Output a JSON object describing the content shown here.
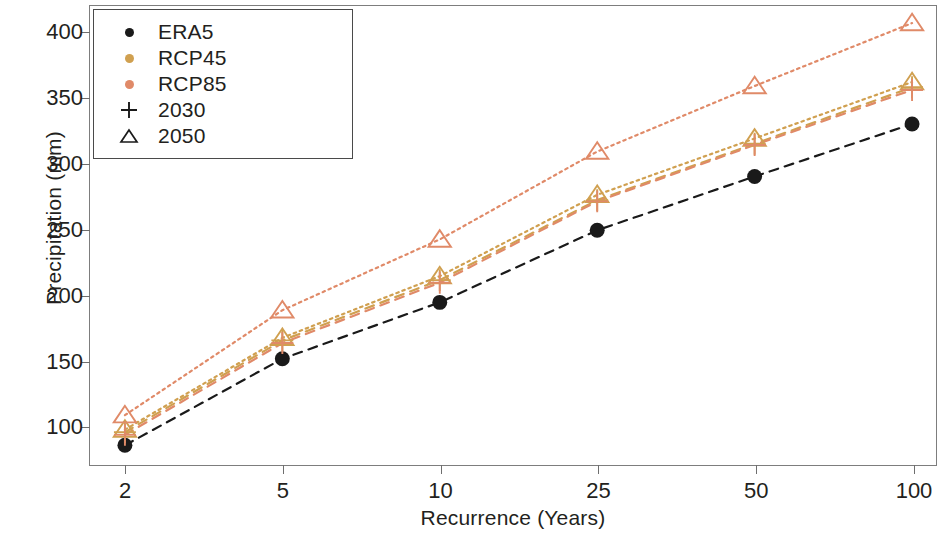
{
  "chart_data": {
    "type": "scatter",
    "title": "",
    "xlabel": "Recurrence (Years)",
    "ylabel": "Precipitation (mm)",
    "categories": [
      "2",
      "5",
      "10",
      "25",
      "50",
      "100"
    ],
    "x_tick_labels": [
      "2",
      "5",
      "10",
      "25",
      "50",
      "100"
    ],
    "y_tick_labels": [
      "100",
      "150",
      "200",
      "250",
      "300",
      "350",
      "400"
    ],
    "ylim": [
      70,
      420
    ],
    "grid": false,
    "legend_position": "upper-left",
    "series": [
      {
        "name": "ERA5",
        "label": "ERA5",
        "color": "#1a1a1a",
        "marker": "circle",
        "line": "dashed",
        "values": [
          85,
          151,
          194,
          249,
          290,
          330
        ]
      },
      {
        "name": "RCP45 2030",
        "label": "RCP45",
        "color": "#d0a050",
        "marker": "plus",
        "line": "dashed",
        "values": [
          95,
          165,
          211,
          272,
          315,
          358
        ]
      },
      {
        "name": "RCP45 2050",
        "label": "RCP45",
        "color": "#d0a050",
        "marker": "triangle",
        "line": "dotted",
        "values": [
          97,
          167,
          214,
          276,
          319,
          362
        ]
      },
      {
        "name": "RCP85 2030",
        "label": "RCP85",
        "color": "#e08a68",
        "marker": "plus",
        "line": "dashed",
        "values": [
          93,
          163,
          209,
          271,
          314,
          356
        ]
      },
      {
        "name": "RCP85 2050",
        "label": "RCP85",
        "color": "#e08a68",
        "marker": "triangle",
        "line": "dotted",
        "values": [
          108,
          188,
          242,
          309,
          359,
          407
        ]
      }
    ]
  },
  "legend": {
    "items": [
      {
        "label": "ERA5",
        "marker": "circle",
        "color": "#1a1a1a"
      },
      {
        "label": "RCP45",
        "marker": "circle",
        "color": "#d0a050"
      },
      {
        "label": "RCP85",
        "marker": "circle",
        "color": "#e08a68"
      },
      {
        "label": "2030",
        "marker": "plus",
        "color": "#1a1a1a"
      },
      {
        "label": "2050",
        "marker": "triangle",
        "color": "#1a1a1a"
      }
    ]
  }
}
